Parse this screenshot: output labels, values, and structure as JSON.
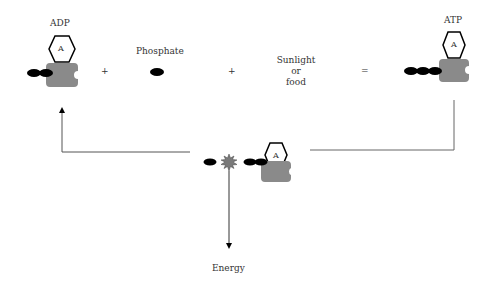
{
  "labels": {
    "adp": "ADP",
    "phosphate": "Phosphate",
    "energy_source_line1": "Sunlight",
    "energy_source_line2": "or",
    "energy_source_line3": "food",
    "atp": "ATP",
    "energy": "Energy",
    "adenine": "A",
    "plus": "+",
    "equals": "="
  },
  "colors": {
    "protein": "#8a8a8a",
    "phosphate": "#000000",
    "line": "#555555",
    "burst": "#7a7a7a"
  }
}
